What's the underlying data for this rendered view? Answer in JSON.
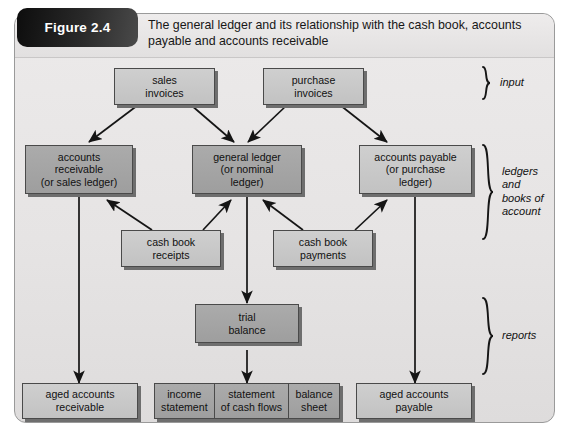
{
  "figure": {
    "tag": "Figure 2.4",
    "title": "The general ledger and its relationship with the cash book, accounts payable and accounts receivable"
  },
  "colors": {
    "frame_bg": "#e8e6e6",
    "box_light": "#cfcfcf",
    "box_dark": "#a5a5a5",
    "box_border": "#4a4a4a",
    "box_shadow": "#6e6e6e",
    "tag_bg": "#1a1a1a",
    "text": "#111111"
  },
  "groups": [
    {
      "id": "input",
      "label": "input"
    },
    {
      "id": "ledgers",
      "label": "ledgers\nand\nbooks of\naccount",
      "lines": [
        "ledgers",
        "and",
        "books of",
        "account"
      ]
    },
    {
      "id": "reports",
      "label": "reports"
    }
  ],
  "nodes": [
    {
      "id": "sales-invoices",
      "lines": [
        "sales",
        "invoices"
      ],
      "tone": "light",
      "group": "input"
    },
    {
      "id": "purchase-invoices",
      "lines": [
        "purchase",
        "invoices"
      ],
      "tone": "light",
      "group": "input"
    },
    {
      "id": "accounts-receivable",
      "lines": [
        "accounts",
        "receivable",
        "(or sales ledger)"
      ],
      "tone": "dark",
      "group": "ledgers"
    },
    {
      "id": "general-ledger",
      "lines": [
        "general ledger",
        "(or nominal",
        "ledger)"
      ],
      "tone": "dark",
      "group": "ledgers"
    },
    {
      "id": "accounts-payable",
      "lines": [
        "accounts payable",
        "(or purchase",
        "ledger)"
      ],
      "tone": "light",
      "group": "ledgers"
    },
    {
      "id": "cash-book-receipts",
      "lines": [
        "cash book",
        "receipts"
      ],
      "tone": "light",
      "group": "ledgers"
    },
    {
      "id": "cash-book-payments",
      "lines": [
        "cash book",
        "payments"
      ],
      "tone": "light",
      "group": "ledgers"
    },
    {
      "id": "trial-balance",
      "lines": [
        "trial",
        "balance"
      ],
      "tone": "dark",
      "group": "reports"
    },
    {
      "id": "aged-accounts-receivable",
      "lines": [
        "aged accounts",
        "receivable"
      ],
      "tone": "light",
      "group": "reports"
    },
    {
      "id": "aged-accounts-payable",
      "lines": [
        "aged accounts",
        "payable"
      ],
      "tone": "light",
      "group": "reports"
    }
  ],
  "segmented_node": {
    "id": "financial-statements",
    "tone": "dark",
    "group": "reports",
    "cells": [
      {
        "id": "income-statement",
        "lines": [
          "income",
          "statement"
        ]
      },
      {
        "id": "statement-cash-flows",
        "lines": [
          "statement",
          "of cash flows"
        ]
      },
      {
        "id": "balance-sheet",
        "lines": [
          "balance",
          "sheet"
        ]
      }
    ]
  },
  "edges": [
    {
      "from": "sales-invoices",
      "to": "accounts-receivable"
    },
    {
      "from": "sales-invoices",
      "to": "general-ledger"
    },
    {
      "from": "purchase-invoices",
      "to": "general-ledger"
    },
    {
      "from": "purchase-invoices",
      "to": "accounts-payable"
    },
    {
      "from": "cash-book-receipts",
      "to": "accounts-receivable"
    },
    {
      "from": "cash-book-receipts",
      "to": "general-ledger"
    },
    {
      "from": "cash-book-payments",
      "to": "general-ledger"
    },
    {
      "from": "cash-book-payments",
      "to": "accounts-payable"
    },
    {
      "from": "general-ledger",
      "to": "trial-balance"
    },
    {
      "from": "trial-balance",
      "to": "financial-statements"
    },
    {
      "from": "accounts-receivable",
      "to": "aged-accounts-receivable"
    },
    {
      "from": "accounts-payable",
      "to": "aged-accounts-payable"
    }
  ]
}
